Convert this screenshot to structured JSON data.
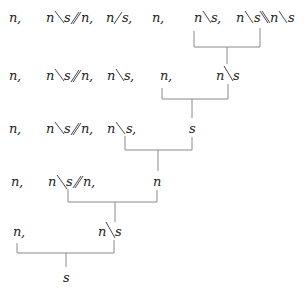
{
  "diagram": {
    "type": "categorial-grammar-derivation",
    "rows": [
      {
        "label": "row-1",
        "tokens": [
          "n,",
          "n\\s//n,",
          "n/s,",
          "n,",
          "n\\s,",
          "n\\s\\\\n\\s"
        ]
      },
      {
        "label": "row-2",
        "tokens": [
          "n,",
          "n\\s//n,",
          "n\\s,",
          "n,",
          "n\\s"
        ]
      },
      {
        "label": "row-3",
        "tokens": [
          "n,",
          "n\\s//n,",
          "n\\s,",
          "s"
        ]
      },
      {
        "label": "row-4",
        "tokens": [
          "n,",
          "n\\s//n,",
          "n"
        ]
      },
      {
        "label": "row-5",
        "tokens": [
          "n,",
          "n\\s"
        ]
      }
    ],
    "result": "s",
    "reductions": [
      {
        "from": [
          "n\\s,",
          "n\\s\\\\n\\s"
        ],
        "to": "n\\s"
      },
      {
        "from": [
          "n,",
          "n\\s"
        ],
        "to": "s"
      },
      {
        "from": [
          "n\\s,",
          "s"
        ],
        "to": "s"
      },
      {
        "from": [
          "n\\s//n,",
          "n"
        ],
        "to": "n\\s"
      },
      {
        "from": [
          "n,",
          "n\\s"
        ],
        "to": "s"
      }
    ],
    "symbols": {
      "n": "n",
      "s": "s",
      "comma": ","
    }
  }
}
